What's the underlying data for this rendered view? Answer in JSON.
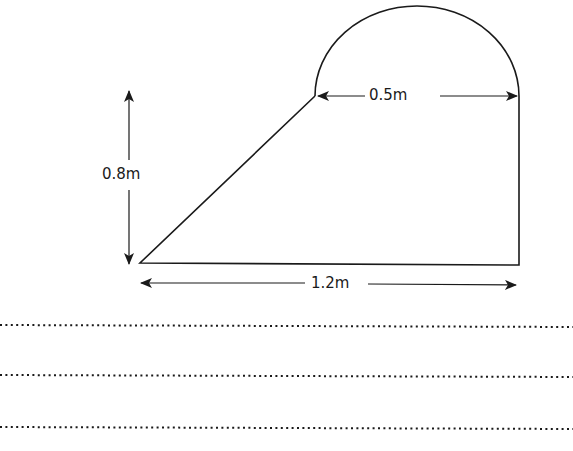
{
  "diagram": {
    "shape": "composite: trapezium with semicircle on top",
    "labels": {
      "height": "0.8m",
      "semicircle_diameter": "0.5m",
      "base": "1.2m"
    },
    "answer_lines": 3,
    "colors": {
      "stroke": "#1a1a1a",
      "background": "#ffffff"
    }
  }
}
